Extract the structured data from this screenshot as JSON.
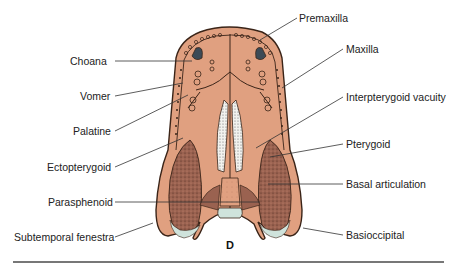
{
  "figure": {
    "panel_letter": "D",
    "colors": {
      "bone": "#e0a080",
      "bone_outline": "#3a2418",
      "stipple_dark": "#8a5a48",
      "cartilage": "#cfe3dc",
      "cavity_dark": "#3c4a56",
      "leader_line": "#333333",
      "rule": "#777777"
    },
    "labels_left": [
      {
        "id": "choana",
        "text": "Choana"
      },
      {
        "id": "vomer",
        "text": "Vomer"
      },
      {
        "id": "palatine",
        "text": "Palatine"
      },
      {
        "id": "ectopterygoid",
        "text": "Ectopterygoid"
      },
      {
        "id": "parasphenoid",
        "text": "Parasphenoid"
      },
      {
        "id": "subtemporal-fenestra",
        "text": "Subtemporal fenestra"
      }
    ],
    "labels_right": [
      {
        "id": "premaxilla",
        "text": "Premaxilla"
      },
      {
        "id": "maxilla",
        "text": "Maxilla"
      },
      {
        "id": "interpterygoid-vacuity",
        "text": "Interpterygoid vacuity"
      },
      {
        "id": "pterygoid",
        "text": "Pterygoid"
      },
      {
        "id": "basal-articulation",
        "text": "Basal articulation"
      },
      {
        "id": "basioccipital",
        "text": "Basioccipital"
      }
    ]
  }
}
